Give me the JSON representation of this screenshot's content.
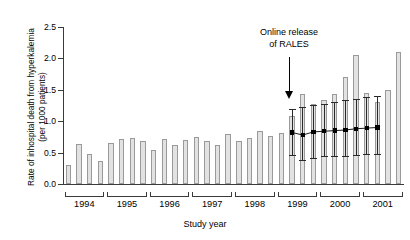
{
  "chart_data": {
    "type": "bar",
    "title": "",
    "xlabel": "Study year",
    "ylabel": "Rate of inhospital death from hyperkalemia\n(per 1000 patients)",
    "ylim": [
      0.0,
      2.5
    ],
    "yticks": [
      0.0,
      0.5,
      1.0,
      1.5,
      2.0,
      2.5
    ],
    "ytick_labels": [
      "0.0",
      "0.5",
      "1.0",
      "1.5",
      "2.0",
      "2.5"
    ],
    "grid": false,
    "legend": null,
    "x_group_labels": [
      "1994",
      "1995",
      "1996",
      "1997",
      "1998",
      "1999",
      "2000",
      "2001"
    ],
    "categories": [
      "1994 Q1",
      "1994 Q2",
      "1994 Q3",
      "1994 Q4",
      "1995 Q1",
      "1995 Q2",
      "1995 Q3",
      "1995 Q4",
      "1996 Q1",
      "1996 Q2",
      "1996 Q3",
      "1996 Q4",
      "1997 Q1",
      "1997 Q2",
      "1997 Q3",
      "1997 Q4",
      "1998 Q1",
      "1998 Q2",
      "1998 Q3",
      "1998 Q4",
      "1999 Q1",
      "1999 Q2",
      "1999 Q3",
      "1999 Q4",
      "2000 Q1",
      "2000 Q2",
      "2000 Q3",
      "2000 Q4",
      "2001 Q1",
      "2001 Q2",
      "2001 Q3",
      "2001 Q4"
    ],
    "values": [
      0.3,
      0.64,
      0.48,
      0.36,
      0.66,
      0.72,
      0.73,
      0.68,
      0.54,
      0.71,
      0.62,
      0.7,
      0.75,
      0.68,
      0.62,
      0.79,
      0.68,
      0.73,
      0.85,
      0.76,
      0.82,
      1.08,
      1.44,
      1.27,
      1.33,
      1.43,
      1.7,
      2.06,
      1.45,
      1.3,
      1.5,
      2.1
    ],
    "series": [
      {
        "name": "Predicted rate (with 95% CI)",
        "x": [
          "1999 Q2",
          "1999 Q3",
          "1999 Q4",
          "2000 Q1",
          "2000 Q2",
          "2000 Q3",
          "2000 Q4",
          "2001 Q1",
          "2001 Q2"
        ],
        "values": [
          0.82,
          0.78,
          0.83,
          0.84,
          0.85,
          0.86,
          0.88,
          0.89,
          0.9
        ],
        "ci_low": [
          0.46,
          0.38,
          0.42,
          0.44,
          0.45,
          0.45,
          0.46,
          0.47,
          0.47
        ],
        "ci_high": [
          1.19,
          1.22,
          1.26,
          1.28,
          1.3,
          1.33,
          1.35,
          1.38,
          1.4
        ]
      }
    ],
    "annotations": [
      {
        "text": "Online release\nof RALES",
        "at_category": "1999 Q2",
        "arrow": "down"
      }
    ]
  }
}
